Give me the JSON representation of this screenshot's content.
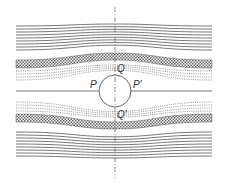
{
  "figure": {
    "type": "streamline flow around a cylinder",
    "labels": {
      "top": "Q",
      "bottom": "Q′",
      "left": "P",
      "right": "P′"
    },
    "colors": {
      "line": "#555555",
      "hatch": "#666666",
      "dots": "#777777",
      "background": "#ffffff"
    },
    "geometry": {
      "center_x": 115,
      "center_y": 91,
      "radius": 16,
      "left_x": 16,
      "right_x": 212,
      "solid_lines_per_side": 9,
      "dotted_lines_per_side": 4
    }
  }
}
